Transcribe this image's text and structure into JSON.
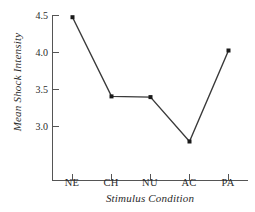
{
  "chart_data": {
    "type": "line",
    "title": "",
    "subtitle": "",
    "xlabel": "Stimulus Condition",
    "ylabel": "Mean Shock Intensity",
    "categories": [
      "NE",
      "CH",
      "NU",
      "AC",
      "PA"
    ],
    "values": [
      4.47,
      3.4,
      3.39,
      2.79,
      4.02
    ],
    "series": [
      {
        "name": "Mean Shock Intensity",
        "values": [
          4.47,
          3.4,
          3.39,
          2.79,
          4.02
        ]
      }
    ],
    "ytick_labels": [
      "4.5",
      "4.0",
      "3.5",
      "3.0"
    ],
    "ytick_values": [
      4.5,
      4.0,
      3.5,
      3.0
    ],
    "ylim": [
      2.62,
      4.53
    ],
    "xlim": [
      0,
      6
    ],
    "grid": false,
    "legend": null,
    "legend_position": "none",
    "marker": "square",
    "line_color": "#3a3a3a",
    "marker_color": "#1a1a1a",
    "axis_color": "#555555",
    "background_color": "#ffffff",
    "annotations": []
  },
  "figure": {
    "axis_label_style": "italic-serif",
    "tick_label_style": "serif"
  }
}
